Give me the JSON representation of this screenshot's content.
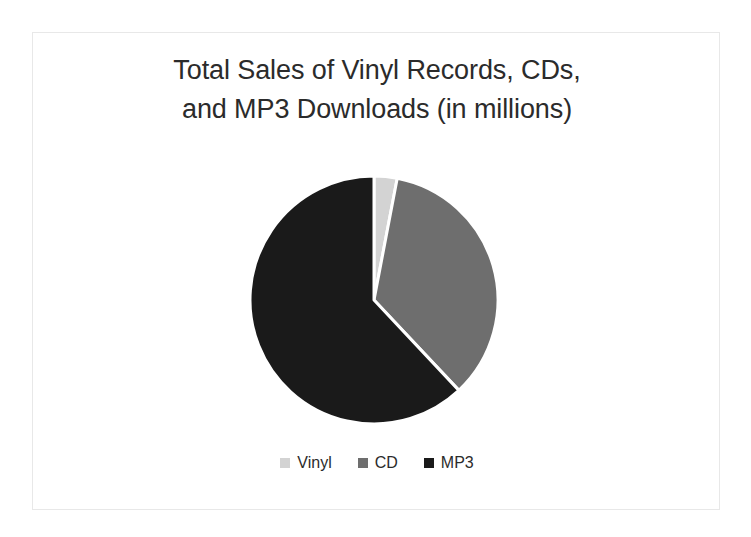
{
  "slide": {
    "background_color": "#FFFFFF",
    "border_color": "#E8E8E8"
  },
  "chart_title": {
    "line1": "Total Sales of Vinyl Records, CDs,",
    "line2": "and MP3 Downloads (in millions)",
    "full": "Total Sales of Vinyl Records, CDs, and MP3 Downloads (in millions)",
    "color": "#2B2B2B"
  },
  "legend": {
    "position": "bottom",
    "items": [
      {
        "label": "Vinyl",
        "color": "#D3D3D3",
        "swatch_icon": "square-swatch-icon"
      },
      {
        "label": "CD",
        "color": "#6E6E6E",
        "swatch_icon": "square-swatch-icon"
      },
      {
        "label": "MP3",
        "color": "#1A1A1A",
        "swatch_icon": "square-swatch-icon"
      }
    ]
  },
  "chart_data": {
    "type": "pie",
    "title": "Total Sales of Vinyl Records, CDs, and MP3 Downloads (in millions)",
    "xlabel": "",
    "ylabel": "",
    "categories": [
      "Vinyl",
      "CD",
      "MP3"
    ],
    "values": [
      3,
      35,
      62
    ],
    "value_unit": "millions",
    "percentages": [
      3,
      35,
      62
    ],
    "colors": [
      "#D3D3D3",
      "#6E6E6E",
      "#1A1A1A"
    ],
    "start_angle_deg": 0,
    "direction": "clockwise",
    "slice_angles_deg": [
      10.8,
      126.0,
      223.2
    ],
    "slice_border_color": "#FFFFFF",
    "slice_border_width": 3,
    "legend": true,
    "legend_position": "bottom",
    "grid": false,
    "data_labels": false,
    "series": [
      {
        "name": "Total Sales (in millions)",
        "values": [
          3,
          35,
          62
        ]
      }
    ]
  },
  "geometry": {
    "center_x": 125,
    "center_y": 125,
    "radius": 124
  }
}
